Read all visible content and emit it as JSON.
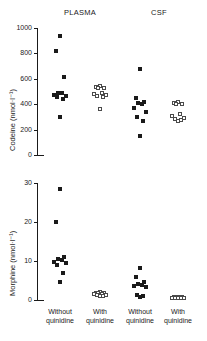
{
  "figure": {
    "panel_headers": [
      {
        "label": "PLASMA",
        "x_center": 80
      },
      {
        "label": "CSF",
        "x_center": 159
      }
    ],
    "group_labels": [
      {
        "line1": "Without",
        "line2": "quinidine",
        "x_center": 60
      },
      {
        "line1": "With",
        "line2": "quinidine",
        "x_center": 100
      },
      {
        "line1": "Without",
        "line2": "quinidine",
        "x_center": 140
      },
      {
        "line1": "With",
        "line2": "quinidine",
        "x_center": 178
      }
    ],
    "colors": {
      "axis": "#1a1a1a",
      "filled_marker": "#1a1a1a",
      "open_marker_edge": "#4a4a4a",
      "open_marker_fill": "#ffffff",
      "background": "#ffffff"
    }
  },
  "chart_data": [
    {
      "type": "scatter",
      "title": "",
      "xlabel": "",
      "ylabel": "Codeine (nmol·l⁻¹)",
      "ylim": [
        0,
        1000
      ],
      "yticks": [
        0,
        200,
        400,
        600,
        800,
        1000
      ],
      "ytick_labels": [
        "0",
        "200",
        "400",
        "600",
        "800",
        "1000"
      ],
      "grid": false,
      "legend": "none",
      "panel_labels": [
        "PLASMA",
        "CSF"
      ],
      "categories": [
        "Without quinidine",
        "With quinidine",
        "Without quinidine",
        "With quinidine"
      ],
      "series": [
        {
          "name": "Plasma without quinidine",
          "marker": "filled-square",
          "category": "Without quinidine",
          "values": [
            940,
            820,
            617,
            490,
            485,
            470,
            462,
            455,
            440,
            300
          ]
        },
        {
          "name": "Plasma with quinidine",
          "marker": "open-square",
          "category": "With quinidine",
          "values": [
            540,
            535,
            530,
            525,
            490,
            480,
            470,
            462,
            455,
            365
          ]
        },
        {
          "name": "CSF without quinidine",
          "marker": "filled-square",
          "category": "Without quinidine",
          "values": [
            675,
            450,
            415,
            408,
            400,
            370,
            335,
            300,
            265,
            150
          ]
        },
        {
          "name": "CSF with quinidine",
          "marker": "open-square",
          "category": "With quinidine",
          "values": [
            420,
            412,
            405,
            398,
            320,
            305,
            295,
            285,
            272,
            265
          ]
        }
      ]
    },
    {
      "type": "scatter",
      "title": "",
      "xlabel": "",
      "ylabel": "Morphine (nmol·l⁻¹)",
      "ylim": [
        0,
        30
      ],
      "yticks": [
        0,
        10,
        20,
        30
      ],
      "ytick_labels": [
        "0",
        "10",
        "20",
        "30"
      ],
      "grid": false,
      "legend": "none",
      "panel_labels": [
        "PLASMA",
        "CSF"
      ],
      "categories": [
        "Without quinidine",
        "With quinidine",
        "Without quinidine",
        "With quinidine"
      ],
      "series": [
        {
          "name": "Plasma without quinidine",
          "marker": "filled-square",
          "category": "Without quinidine",
          "values": [
            28.5,
            20.1,
            11.0,
            10.6,
            10.2,
            9.8,
            9.4,
            9.0,
            7.0,
            4.7
          ]
        },
        {
          "name": "Plasma with quinidine",
          "marker": "open-square",
          "category": "With quinidine",
          "values": [
            2.0,
            1.9,
            1.8,
            1.7,
            1.6,
            1.5,
            1.4,
            1.3,
            1.1,
            0.9
          ]
        },
        {
          "name": "CSF without quinidine",
          "marker": "filled-square",
          "category": "Without quinidine",
          "values": [
            8.3,
            6.0,
            4.5,
            4.2,
            3.9,
            3.6,
            3.4,
            1.3,
            1.0,
            0.8
          ]
        },
        {
          "name": "CSF with quinidine",
          "marker": "open-square",
          "category": "With quinidine",
          "values": [
            0.8,
            0.7,
            0.7,
            0.6,
            0.6,
            0.5,
            0.5,
            0.5,
            0.4,
            0.4
          ]
        }
      ]
    }
  ]
}
